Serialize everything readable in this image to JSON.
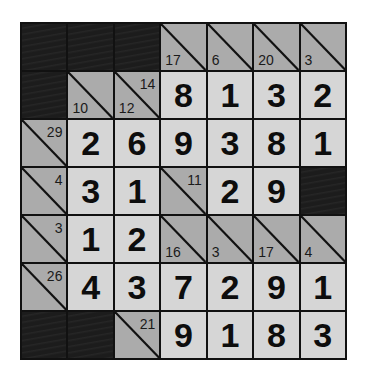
{
  "puzzle": {
    "type": "kakuro",
    "rows": 7,
    "cols": 7,
    "colors": {
      "black": "#1c1c1c",
      "clue": "#ababab",
      "entry": "#d6d6d6",
      "border": "#111111"
    },
    "grid": [
      [
        {
          "t": "black"
        },
        {
          "t": "black"
        },
        {
          "t": "black"
        },
        {
          "t": "clue",
          "down": "17"
        },
        {
          "t": "clue",
          "down": "6"
        },
        {
          "t": "clue",
          "down": "20"
        },
        {
          "t": "clue",
          "down": "3"
        }
      ],
      [
        {
          "t": "black"
        },
        {
          "t": "clue",
          "down": "10"
        },
        {
          "t": "clue",
          "down": "12",
          "across": "14"
        },
        {
          "t": "num",
          "v": "8"
        },
        {
          "t": "num",
          "v": "1"
        },
        {
          "t": "num",
          "v": "3"
        },
        {
          "t": "num",
          "v": "2"
        }
      ],
      [
        {
          "t": "clue",
          "across": "29"
        },
        {
          "t": "num",
          "v": "2"
        },
        {
          "t": "num",
          "v": "6"
        },
        {
          "t": "num",
          "v": "9"
        },
        {
          "t": "num",
          "v": "3"
        },
        {
          "t": "num",
          "v": "8"
        },
        {
          "t": "num",
          "v": "1"
        }
      ],
      [
        {
          "t": "clue",
          "across": "4"
        },
        {
          "t": "num",
          "v": "3"
        },
        {
          "t": "num",
          "v": "1"
        },
        {
          "t": "clue",
          "across": "11"
        },
        {
          "t": "num",
          "v": "2"
        },
        {
          "t": "num",
          "v": "9"
        },
        {
          "t": "black"
        }
      ],
      [
        {
          "t": "clue",
          "across": "3"
        },
        {
          "t": "num",
          "v": "1"
        },
        {
          "t": "num",
          "v": "2"
        },
        {
          "t": "clue",
          "down": "16"
        },
        {
          "t": "clue",
          "down": "3"
        },
        {
          "t": "clue",
          "down": "17"
        },
        {
          "t": "clue",
          "down": "4"
        }
      ],
      [
        {
          "t": "clue",
          "across": "26"
        },
        {
          "t": "num",
          "v": "4"
        },
        {
          "t": "num",
          "v": "3"
        },
        {
          "t": "num",
          "v": "7"
        },
        {
          "t": "num",
          "v": "2"
        },
        {
          "t": "num",
          "v": "9"
        },
        {
          "t": "num",
          "v": "1"
        }
      ],
      [
        {
          "t": "black"
        },
        {
          "t": "black"
        },
        {
          "t": "clue",
          "across": "21"
        },
        {
          "t": "num",
          "v": "9"
        },
        {
          "t": "num",
          "v": "1"
        },
        {
          "t": "num",
          "v": "8"
        },
        {
          "t": "num",
          "v": "3"
        }
      ]
    ]
  }
}
